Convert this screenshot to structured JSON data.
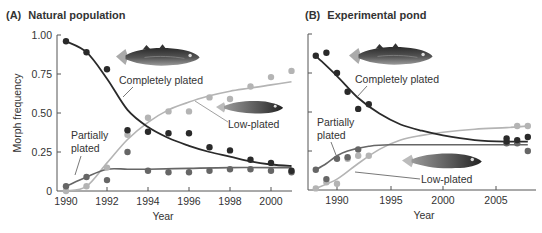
{
  "figure": {
    "panels": [
      {
        "label": "(A)",
        "title": "Natural population"
      },
      {
        "label": "(B)",
        "title": "Experimental pond"
      }
    ]
  },
  "colors": {
    "completely": "#2a2a2a",
    "low": "#b4b4b4",
    "partial": "#666666",
    "axis": "#555555",
    "text": "#333333"
  },
  "chart_data": [
    {
      "type": "scatter",
      "title": "(A) Natural population",
      "xlabel": "Year",
      "ylabel": "Morph frequency",
      "xlim": [
        1989.8,
        2001.2
      ],
      "ylim": [
        0,
        1
      ],
      "xticks": [
        1990,
        1992,
        1994,
        1996,
        1998,
        2000
      ],
      "yticks": [
        0,
        0.25,
        0.5,
        0.75,
        1.0
      ],
      "ytick_labels": [
        "0",
        "0.25",
        "0.50",
        "0.75",
        "1.00"
      ],
      "grid": false,
      "legend": "inline labels",
      "series": [
        {
          "name": "Completely plated",
          "x": [
            1990,
            1991,
            1992,
            1993,
            1994,
            1995,
            1996,
            1997,
            1998,
            1999,
            2000,
            2001
          ],
          "values": [
            0.96,
            0.89,
            0.78,
            0.39,
            0.38,
            0.37,
            0.37,
            0.28,
            0.26,
            0.2,
            0.18,
            0.13
          ],
          "fit": [
            [
              1990,
              0.96
            ],
            [
              1991,
              0.89
            ],
            [
              1992,
              0.72
            ],
            [
              1993,
              0.52
            ],
            [
              1994,
              0.41
            ],
            [
              1995,
              0.34
            ],
            [
              1996,
              0.29
            ],
            [
              1997,
              0.25
            ],
            [
              1998,
              0.22
            ],
            [
              1999,
              0.19
            ],
            [
              2000,
              0.17
            ],
            [
              2001,
              0.16
            ]
          ]
        },
        {
          "name": "Low-plated",
          "x": [
            1990,
            1991,
            1992,
            1993,
            1994,
            1995,
            1996,
            1997,
            1998,
            1999,
            2000,
            2001
          ],
          "values": [
            0.0,
            0.03,
            0.15,
            0.36,
            0.47,
            0.51,
            0.51,
            0.6,
            0.59,
            0.67,
            0.73,
            0.77
          ],
          "fit": [
            [
              1990,
              0.0
            ],
            [
              1991,
              0.03
            ],
            [
              1992,
              0.18
            ],
            [
              1993,
              0.33
            ],
            [
              1994,
              0.44
            ],
            [
              1995,
              0.52
            ],
            [
              1996,
              0.57
            ],
            [
              1997,
              0.61
            ],
            [
              1998,
              0.64
            ],
            [
              1999,
              0.66
            ],
            [
              2000,
              0.68
            ],
            [
              2001,
              0.7
            ]
          ]
        },
        {
          "name": "Partially plated",
          "x": [
            1990,
            1991,
            1992,
            1993,
            1994,
            1995,
            1996,
            1997,
            1998,
            1999,
            2000,
            2001
          ],
          "values": [
            0.03,
            0.09,
            0.07,
            0.25,
            0.13,
            0.12,
            0.12,
            0.13,
            0.14,
            0.14,
            0.13,
            0.12
          ],
          "fit": [
            [
              1990,
              0.03
            ],
            [
              1991,
              0.09
            ],
            [
              1992,
              0.14
            ],
            [
              1993,
              0.14
            ],
            [
              1994,
              0.14
            ],
            [
              1996,
              0.145
            ],
            [
              1998,
              0.15
            ],
            [
              2000,
              0.15
            ],
            [
              2001,
              0.15
            ]
          ]
        }
      ],
      "annotations": [
        "Completely plated",
        "Low-plated",
        "Partially plated"
      ]
    },
    {
      "type": "scatter",
      "title": "(B) Experimental pond",
      "xlabel": "Year",
      "ylabel": "",
      "xlim": [
        1987.7,
        2008.8
      ],
      "ylim": [
        0,
        1
      ],
      "xticks": [
        1990,
        1995,
        2000,
        2005
      ],
      "yticks": [
        0,
        0.25,
        0.5,
        0.75,
        1.0
      ],
      "ytick_labels": [],
      "grid": false,
      "legend": "inline labels",
      "series": [
        {
          "name": "Completely plated",
          "x": [
            1988,
            1989,
            1990,
            1991,
            1992,
            1993,
            2006,
            2006,
            2007,
            2008
          ],
          "values": [
            0.86,
            0.88,
            0.75,
            0.63,
            0.52,
            0.55,
            0.31,
            0.33,
            0.32,
            0.34
          ],
          "fit": [
            [
              1988,
              0.86
            ],
            [
              1990,
              0.73
            ],
            [
              1992,
              0.59
            ],
            [
              1994,
              0.49
            ],
            [
              1996,
              0.42
            ],
            [
              1998,
              0.38
            ],
            [
              2000,
              0.35
            ],
            [
              2003,
              0.32
            ],
            [
              2006,
              0.31
            ],
            [
              2008,
              0.31
            ]
          ]
        },
        {
          "name": "Low-plated",
          "x": [
            1988,
            1989,
            1990,
            1991,
            1992,
            1993,
            2007,
            2008
          ],
          "values": [
            0.01,
            0.05,
            0.04,
            0.2,
            0.22,
            0.22,
            0.41,
            0.41
          ],
          "fit": [
            [
              1988,
              0.01
            ],
            [
              1990,
              0.07
            ],
            [
              1992,
              0.17
            ],
            [
              1994,
              0.26
            ],
            [
              1996,
              0.32
            ],
            [
              1998,
              0.35
            ],
            [
              2000,
              0.37
            ],
            [
              2003,
              0.39
            ],
            [
              2006,
              0.4
            ],
            [
              2008,
              0.41
            ]
          ]
        },
        {
          "name": "Partially plated",
          "x": [
            1988,
            1989,
            1990,
            1991,
            1992,
            2006,
            2007,
            2008
          ],
          "values": [
            0.13,
            0.07,
            0.2,
            0.21,
            0.26,
            0.3,
            0.3,
            0.25
          ],
          "fit": [
            [
              1988,
              0.13
            ],
            [
              1989,
              0.17
            ],
            [
              1990,
              0.22
            ],
            [
              1991,
              0.25
            ],
            [
              1993,
              0.28
            ],
            [
              1995,
              0.29
            ],
            [
              2000,
              0.29
            ],
            [
              2005,
              0.29
            ],
            [
              2008,
              0.29
            ]
          ]
        }
      ],
      "annotations": [
        "Completely plated",
        "Partially plated",
        "Low-plated"
      ]
    }
  ]
}
